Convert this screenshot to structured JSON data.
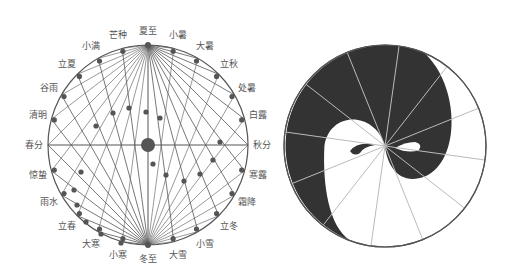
{
  "figure": {
    "background": "#ffffff",
    "line_color": "#555555",
    "fill_dark": "#333333",
    "left_diagram": {
      "title": "二十四节气日影图",
      "center": [
        148,
        145
      ],
      "radius": 100,
      "solar_terms": [
        {
          "name": "夏至",
          "angle": 90
        },
        {
          "name": "小暑",
          "angle": 75
        },
        {
          "name": "大暑",
          "angle": 60
        },
        {
          "name": "立秋",
          "angle": 45
        },
        {
          "name": "处暑",
          "angle": 30
        },
        {
          "name": "白露",
          "angle": 15
        },
        {
          "name": "秋分",
          "angle": 0
        },
        {
          "name": "寒露",
          "angle": -15
        },
        {
          "name": "霜降",
          "angle": -30
        },
        {
          "name": "立冬",
          "angle": -45
        },
        {
          "name": "小雪",
          "angle": -60
        },
        {
          "name": "大雪",
          "angle": -75
        },
        {
          "name": "冬至",
          "angle": -90
        },
        {
          "name": "小寒",
          "angle": -105
        },
        {
          "name": "大寒",
          "angle": -120
        },
        {
          "name": "立春",
          "angle": -135
        },
        {
          "name": "雨水",
          "angle": -150
        },
        {
          "name": "惊蛰",
          "angle": -165
        },
        {
          "name": "春分",
          "angle": 180
        },
        {
          "name": "清明",
          "angle": 165
        },
        {
          "name": "谷雨",
          "angle": 150
        },
        {
          "name": "立夏",
          "angle": 135
        },
        {
          "name": "小满",
          "angle": 120
        },
        {
          "name": "芒种",
          "angle": 105
        }
      ]
    },
    "right_diagram": {
      "title": "太极图",
      "center": [
        385,
        146
      ],
      "radius": 101,
      "spokes": 12
    }
  }
}
